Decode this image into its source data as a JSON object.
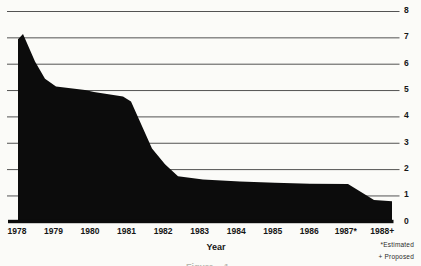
{
  "chart_data": {
    "type": "area",
    "title": "",
    "xlabel": "Year",
    "ylabel": "",
    "categories": [
      "1978",
      "1979",
      "1980",
      "1981",
      "1982",
      "1983",
      "1984",
      "1985",
      "1986",
      "1987*",
      "1988+"
    ],
    "values": [
      7.1,
      5.1,
      5.0,
      4.6,
      2.2,
      1.6,
      1.6,
      1.5,
      1.5,
      1.4,
      0.8
    ],
    "ylim": [
      0,
      8
    ],
    "yticks": [
      0,
      1,
      2,
      3,
      4,
      5,
      6,
      7,
      8
    ],
    "ytick_side": "right",
    "grid": "horizontal",
    "legend": "none",
    "fill_color": "#0c0c0c",
    "gridline_color": "#3f3f3f",
    "background_color": "#fbfbf8",
    "profile": [
      [
        0.027,
        6.95
      ],
      [
        0.164,
        7.15
      ],
      [
        0.493,
        6.1
      ],
      [
        0.766,
        5.45
      ],
      [
        1.068,
        5.15
      ],
      [
        1.861,
        5.02
      ],
      [
        2.108,
        4.95
      ],
      [
        2.902,
        4.77
      ],
      [
        3.121,
        4.58
      ],
      [
        3.695,
        2.8
      ],
      [
        4.051,
        2.2
      ],
      [
        4.407,
        1.75
      ],
      [
        5.091,
        1.62
      ],
      [
        6.104,
        1.55
      ],
      [
        7.062,
        1.5
      ],
      [
        8.02,
        1.46
      ],
      [
        9.06,
        1.45
      ],
      [
        9.772,
        0.85
      ],
      [
        10.265,
        0.8
      ]
    ]
  },
  "footnotes": {
    "estimated": "*Estimated",
    "proposed": "+ Proposed"
  },
  "caption_fragment": "Figure 1"
}
